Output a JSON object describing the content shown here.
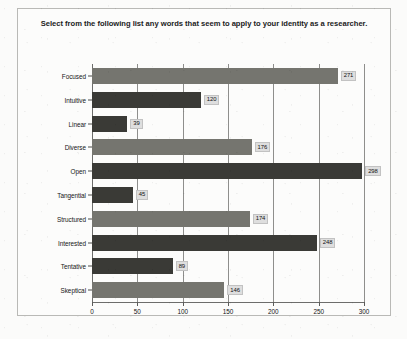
{
  "chart_data": {
    "type": "bar",
    "orientation": "horizontal",
    "title": "Select from the following list any words that seem to apply to your identity as a researcher.",
    "title_line1": "Select from the following list any words that seem to apply to your identity as a",
    "title_line2": "researcher.",
    "xlabel": "",
    "ylabel": "",
    "xlim": [
      0,
      300
    ],
    "ylim": null,
    "grid": true,
    "legend": false,
    "xticks": [
      "0",
      "50",
      "100",
      "150",
      "200",
      "250",
      "300"
    ],
    "xtick_values": [
      0,
      50,
      100,
      150,
      200,
      250,
      300
    ],
    "categories": [
      "Focused",
      "Intuitive",
      "Linear",
      "Diverse",
      "Open",
      "Tangential",
      "Structured",
      "Interested",
      "Tentative",
      "Skeptical"
    ],
    "values": [
      271,
      120,
      39,
      176,
      298,
      45,
      174,
      248,
      89,
      146
    ],
    "value_labels": [
      "271",
      "120",
      "39",
      "176",
      "298",
      "45",
      "174",
      "248",
      "89",
      "146"
    ],
    "bar_shades": [
      "light",
      "dark",
      "dark",
      "light",
      "dark",
      "dark",
      "light",
      "dark",
      "dark",
      "light"
    ],
    "colors": {
      "bar_light": "#75756f",
      "bar_dark": "#3a3a36",
      "gridline": "#8e8e8c",
      "axis": "#6d6d6b",
      "label_box": "#dedede",
      "text": "#161616",
      "frame": "#b9b9b6",
      "background": "#fcfcfb"
    }
  }
}
